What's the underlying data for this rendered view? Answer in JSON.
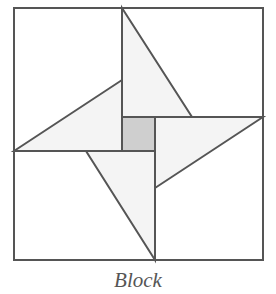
{
  "diagram": {
    "caption": "Block",
    "colors": {
      "stroke": "#555555",
      "triangle_fill": "#f4f4f4",
      "center_fill": "#cfcfcf",
      "background": "#ffffff"
    },
    "outer_square": {
      "x": 14,
      "y": 8,
      "width": 249,
      "height": 252
    },
    "center_square": {
      "x": 122,
      "y": 117,
      "width": 33,
      "height": 34
    },
    "triangles": [
      {
        "name": "top",
        "points": "122,8 192,117 122,117"
      },
      {
        "name": "right",
        "points": "263,117 155,188 155,117"
      },
      {
        "name": "bottom",
        "points": "155,260 86,151 155,151"
      },
      {
        "name": "left",
        "points": "14,151 122,80 122,151"
      }
    ]
  }
}
